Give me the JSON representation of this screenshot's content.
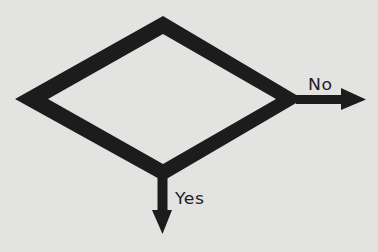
{
  "diagram": {
    "type": "flowchart-decision",
    "shape": "diamond",
    "colors": {
      "stroke": "#1c1c1c",
      "background": "#e3e3e1",
      "text": "#1e1e1e"
    },
    "branches": [
      {
        "id": "no",
        "label": "No",
        "direction": "right"
      },
      {
        "id": "yes",
        "label": "Yes",
        "direction": "down"
      }
    ]
  }
}
